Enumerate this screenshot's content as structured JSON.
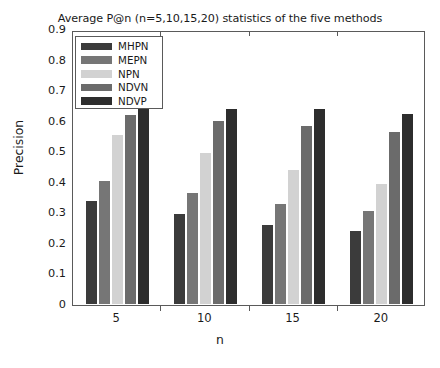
{
  "chart_data": {
    "type": "bar",
    "title": "Average P@n (n=5,10,15,20) statistics of the five methods",
    "xlabel": "n",
    "ylabel": "Precision",
    "categories": [
      "5",
      "10",
      "15",
      "20"
    ],
    "ylim": [
      0,
      0.9
    ],
    "ytick_labels": [
      "0",
      "0.1",
      "0.2",
      "0.3",
      "0.4",
      "0.5",
      "0.6",
      "0.7",
      "0.8",
      "0.9"
    ],
    "ytick_values": [
      0,
      0.1,
      0.2,
      0.3,
      0.4,
      0.5,
      0.6,
      0.7,
      0.8,
      0.9
    ],
    "grid": false,
    "legend_position": "upper-left",
    "series": [
      {
        "name": "MHPN",
        "color": "#3b3b3b",
        "values": [
          0.345,
          0.3,
          0.265,
          0.245
        ]
      },
      {
        "name": "MEPN",
        "color": "#767676",
        "values": [
          0.41,
          0.37,
          0.335,
          0.31
        ]
      },
      {
        "name": "NPN",
        "color": "#d2d2d2",
        "values": [
          0.56,
          0.5,
          0.445,
          0.4
        ]
      },
      {
        "name": "NDVN",
        "color": "#6b6b6b",
        "values": [
          0.625,
          0.605,
          0.59,
          0.57
        ]
      },
      {
        "name": "NDVP",
        "color": "#2d2d2d",
        "values": [
          0.645,
          0.645,
          0.645,
          0.63
        ]
      }
    ]
  },
  "axis_colors": {
    "frame": "#5a5a5a",
    "text": "#1a1a1a",
    "background": "#ffffff"
  }
}
